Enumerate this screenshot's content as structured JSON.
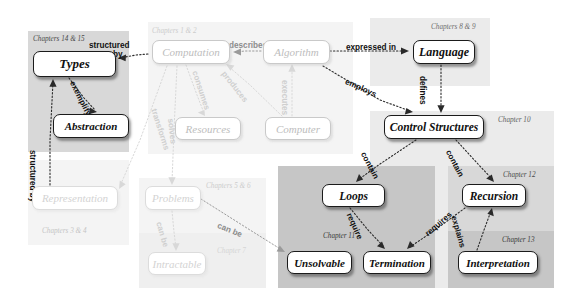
{
  "diagram": {
    "colors": {
      "region_dark": "#c6c6c6",
      "region_mid": "#d8d8d8",
      "region_light": "#ebebeb",
      "region_faint": "#f4f4f4",
      "node_strong_border": "#1b1b1b",
      "node_mid_border": "#7d7d7d",
      "node_faint_border": "#c9c9c9",
      "background": "#ffffff"
    },
    "regions": [
      {
        "name": "region-chapters-14-15",
        "label": "Chapters 14 & 15",
        "tone": "mid",
        "x": 28,
        "y": 31,
        "w": 101,
        "h": 121,
        "label_x": 33,
        "label_y": 35,
        "label_size": 7.2,
        "label_color": "#4a4a4a"
      },
      {
        "name": "region-chapters-3-4",
        "label": "Chapters 3 & 4",
        "tone": "faint",
        "x": 28,
        "y": 160,
        "w": 101,
        "h": 85,
        "label_x": 42,
        "label_y": 227,
        "label_size": 7.2,
        "label_color": "#c4c4c4"
      },
      {
        "name": "region-chapters-1-2",
        "label": "Chapters 1 & 2",
        "tone": "faint",
        "x": 148,
        "y": 22,
        "w": 205,
        "h": 132,
        "label_x": 152,
        "label_y": 27,
        "label_size": 7.2,
        "label_color": "#cccccc"
      },
      {
        "name": "region-chapters-5-6",
        "label": "Chapters 5 & 6",
        "tone": "faint",
        "x": 139,
        "y": 178,
        "w": 127,
        "h": 110,
        "label_x": 206,
        "label_y": 182,
        "label_size": 7.2,
        "label_color": "#cccccc"
      },
      {
        "name": "region-chapter-7",
        "label": "Chapter 7",
        "tone": "faint2",
        "x": 139,
        "y": 233,
        "w": 127,
        "h": 55,
        "label_x": 217,
        "label_y": 247,
        "label_size": 7.2,
        "label_color": "#d5d5d5"
      },
      {
        "name": "region-chapters-8-9",
        "label": "Chapters 8 & 9",
        "tone": "light",
        "x": 370,
        "y": 18,
        "w": 120,
        "h": 68,
        "label_x": 431,
        "label_y": 23,
        "label_size": 7.2,
        "label_color": "#6e6e6e"
      },
      {
        "name": "region-chapter-10",
        "label": "Chapter 10",
        "tone": "light",
        "x": 370,
        "y": 111,
        "w": 184,
        "h": 177,
        "label_x": 498,
        "label_y": 116,
        "label_size": 7.2,
        "label_color": "#5f5f5f"
      },
      {
        "name": "region-chapter-12",
        "label": "Chapter 12",
        "tone": "mid",
        "x": 448,
        "y": 166,
        "w": 106,
        "h": 122,
        "label_x": 503,
        "label_y": 171,
        "label_size": 7.2,
        "label_color": "#4a4a4a"
      },
      {
        "name": "region-chapter-11",
        "label": "Chapter 11",
        "tone": "dark",
        "x": 278,
        "y": 166,
        "w": 157,
        "h": 122,
        "label_x": 323,
        "label_y": 232,
        "label_size": 7.2,
        "label_color": "#3a3a3a"
      },
      {
        "name": "region-chapter-13",
        "label": "Chapter 13",
        "tone": "dark",
        "x": 448,
        "y": 231,
        "w": 106,
        "h": 57,
        "label_x": 502,
        "label_y": 236,
        "label_size": 7.2,
        "label_color": "#3a3a3a"
      }
    ],
    "nodes": [
      {
        "name": "node-types",
        "label": "Types",
        "style": "strong",
        "x": 33,
        "y": 51,
        "w": 83,
        "h": 26,
        "fs": 13
      },
      {
        "name": "node-abstraction",
        "label": "Abstraction",
        "style": "strong",
        "x": 53,
        "y": 114,
        "w": 76,
        "h": 24,
        "fs": 11
      },
      {
        "name": "node-representation",
        "label": "Representation",
        "style": "fainter",
        "x": 32,
        "y": 186,
        "w": 86,
        "h": 24,
        "fs": 11
      },
      {
        "name": "node-computation",
        "label": "Computation",
        "style": "faint",
        "x": 152,
        "y": 40,
        "w": 78,
        "h": 24,
        "fs": 11
      },
      {
        "name": "node-resources",
        "label": "Resources",
        "style": "faint",
        "x": 175,
        "y": 117,
        "w": 66,
        "h": 23,
        "fs": 11
      },
      {
        "name": "node-algorithm",
        "label": "Algorithm",
        "style": "faint",
        "x": 263,
        "y": 40,
        "w": 67,
        "h": 24,
        "fs": 11
      },
      {
        "name": "node-computer",
        "label": "Computer",
        "style": "faint",
        "x": 265,
        "y": 117,
        "w": 66,
        "h": 23,
        "fs": 11
      },
      {
        "name": "node-problems",
        "label": "Problems",
        "style": "fainter",
        "x": 145,
        "y": 186,
        "w": 56,
        "h": 24,
        "fs": 11
      },
      {
        "name": "node-intractable",
        "label": "Intractable",
        "style": "fainter",
        "x": 148,
        "y": 252,
        "w": 58,
        "h": 23,
        "fs": 11
      },
      {
        "name": "node-language",
        "label": "Language",
        "style": "strong",
        "x": 413,
        "y": 40,
        "w": 62,
        "h": 24,
        "fs": 12
      },
      {
        "name": "node-control-structures",
        "label": "Control Structures",
        "style": "strong",
        "x": 384,
        "y": 115,
        "w": 100,
        "h": 24,
        "fs": 11.5
      },
      {
        "name": "node-loops",
        "label": "Loops",
        "style": "strong",
        "x": 322,
        "y": 184,
        "w": 63,
        "h": 23,
        "fs": 11.5
      },
      {
        "name": "node-recursion",
        "label": "Recursion",
        "style": "strong",
        "x": 462,
        "y": 184,
        "w": 64,
        "h": 23,
        "fs": 11.5
      },
      {
        "name": "node-unsolvable",
        "label": "Unsolvable",
        "style": "strong",
        "x": 287,
        "y": 251,
        "w": 65,
        "h": 23,
        "fs": 11
      },
      {
        "name": "node-termination",
        "label": "Termination",
        "style": "strong",
        "x": 363,
        "y": 251,
        "w": 68,
        "h": 23,
        "fs": 11
      },
      {
        "name": "node-interpretation",
        "label": "Interpretation",
        "style": "strong",
        "x": 458,
        "y": 251,
        "w": 80,
        "h": 23,
        "fs": 11
      }
    ],
    "edges": [
      {
        "name": "edge-computation-structured-by-types",
        "label": "structured by",
        "tone": "dark",
        "from": "node-computation",
        "to": "node-types"
      },
      {
        "name": "edge-types-exemplify-abstraction",
        "label": "exemplify",
        "tone": "dark",
        "from": "node-types",
        "to": "node-abstraction"
      },
      {
        "name": "edge-representation-structured-by-types",
        "label": "structured by",
        "tone": "dark",
        "from": "node-representation",
        "to": "node-types"
      },
      {
        "name": "edge-algorithm-describes-computation",
        "label": "describes",
        "tone": "gray",
        "from": "node-algorithm",
        "to": "node-computation"
      },
      {
        "name": "edge-computation-consumes-resources",
        "label": "consumes",
        "tone": "pale",
        "from": "node-computation",
        "to": "node-resources"
      },
      {
        "name": "edge-computer-produces-computation",
        "label": "produces",
        "tone": "pale",
        "from": "node-computer",
        "to": "node-computation"
      },
      {
        "name": "edge-computer-executes-algorithm",
        "label": "executes",
        "tone": "pale",
        "from": "node-computer",
        "to": "node-algorithm"
      },
      {
        "name": "edge-computation-transforms-representation",
        "label": "transforms",
        "tone": "pale",
        "from": "node-computation",
        "to": "node-representation"
      },
      {
        "name": "edge-computation-solves-problems",
        "label": "solves",
        "tone": "pale",
        "from": "node-computation",
        "to": "node-problems"
      },
      {
        "name": "edge-algorithm-expressed-in-language",
        "label": "expressed in",
        "tone": "dark",
        "from": "node-algorithm",
        "to": "node-language"
      },
      {
        "name": "edge-algorithm-employs-control-structures",
        "label": "employs",
        "tone": "dark",
        "from": "node-algorithm",
        "to": "node-control-structures"
      },
      {
        "name": "edge-language-defines-control-structures",
        "label": "defines",
        "tone": "dark",
        "from": "node-language",
        "to": "node-control-structures"
      },
      {
        "name": "edge-control-structures-contain-loops",
        "label": "contain",
        "tone": "dark",
        "from": "node-control-structures",
        "to": "node-loops"
      },
      {
        "name": "edge-control-structures-contain-recursion",
        "label": "contain",
        "tone": "dark",
        "from": "node-control-structures",
        "to": "node-recursion"
      },
      {
        "name": "edge-loops-require-termination",
        "label": "require",
        "tone": "dark",
        "from": "node-loops",
        "to": "node-termination"
      },
      {
        "name": "edge-recursion-requires-termination",
        "label": "requires",
        "tone": "dark",
        "from": "node-recursion",
        "to": "node-termination"
      },
      {
        "name": "edge-interpretation-explains-recursion",
        "label": "explains",
        "tone": "dark",
        "from": "node-interpretation",
        "to": "node-recursion"
      },
      {
        "name": "edge-problems-can-be-intractable",
        "label": "can be",
        "tone": "pale",
        "from": "node-problems",
        "to": "node-intractable"
      },
      {
        "name": "edge-problems-can-be-unsolvable",
        "label": "can be",
        "tone": "gray",
        "from": "node-problems",
        "to": "node-unsolvable"
      }
    ],
    "edge_labels": [
      {
        "name": "edge-label-structured-by-top",
        "text": "structured",
        "tone": "dark",
        "x": 89,
        "y": 42,
        "fs": 8.2,
        "rot": 0,
        "align": "left"
      },
      {
        "name": "edge-label-structured-by-top2",
        "text": "by",
        "tone": "dark",
        "x": 113,
        "y": 51,
        "fs": 8.2,
        "rot": 0,
        "align": "left"
      },
      {
        "name": "edge-label-exemplify",
        "text": "exemplify",
        "tone": "dark",
        "x": 75,
        "y": 80,
        "fs": 8.2,
        "rot": 63,
        "align": "left"
      },
      {
        "name": "edge-label-structured-by-left",
        "text": "structured by",
        "tone": "dark",
        "x": 36,
        "y": 150,
        "fs": 8.2,
        "rot": 90,
        "align": "left"
      },
      {
        "name": "edge-label-describes",
        "text": "describes",
        "tone": "gray",
        "x": 229,
        "y": 42,
        "fs": 8.2,
        "rot": 0,
        "align": "left"
      },
      {
        "name": "edge-label-consumes",
        "text": "consumes",
        "tone": "pale",
        "x": 198,
        "y": 70,
        "fs": 8.2,
        "rot": 72,
        "align": "left"
      },
      {
        "name": "edge-label-produces",
        "text": "produces",
        "tone": "pale",
        "x": 226,
        "y": 70,
        "fs": 8.2,
        "rot": 52,
        "align": "left"
      },
      {
        "name": "edge-label-executes",
        "text": "executes",
        "tone": "pale",
        "x": 288,
        "y": 80,
        "fs": 8.2,
        "rot": 90,
        "align": "left"
      },
      {
        "name": "edge-label-transforms",
        "text": "transforms",
        "tone": "pale",
        "x": 157,
        "y": 108,
        "fs": 8.2,
        "rot": 72,
        "align": "left"
      },
      {
        "name": "edge-label-solves",
        "text": "solves",
        "tone": "pale",
        "x": 174,
        "y": 118,
        "fs": 8.2,
        "rot": 84,
        "align": "left"
      },
      {
        "name": "edge-label-expressed-in",
        "text": "expressed in",
        "tone": "dark",
        "x": 346,
        "y": 44,
        "fs": 8.2,
        "rot": 0,
        "align": "left"
      },
      {
        "name": "edge-label-employs",
        "text": "employs",
        "tone": "dark",
        "x": 347,
        "y": 78,
        "fs": 8.2,
        "rot": 24,
        "align": "left"
      },
      {
        "name": "edge-label-defines",
        "text": "defines",
        "tone": "dark",
        "x": 426,
        "y": 76,
        "fs": 8.2,
        "rot": 90,
        "align": "left"
      },
      {
        "name": "edge-label-contain-left",
        "text": "contain",
        "tone": "dark",
        "x": 366,
        "y": 151,
        "fs": 8.2,
        "rot": 62,
        "align": "left"
      },
      {
        "name": "edge-label-contain-right",
        "text": "contain",
        "tone": "dark",
        "x": 451,
        "y": 149,
        "fs": 8.2,
        "rot": 62,
        "align": "left"
      },
      {
        "name": "edge-label-require",
        "text": "require",
        "tone": "dark",
        "x": 352,
        "y": 212,
        "fs": 8.2,
        "rot": 66,
        "align": "left"
      },
      {
        "name": "edge-label-requires",
        "text": "requires",
        "tone": "dark",
        "x": 424,
        "y": 232,
        "fs": 8.2,
        "rot": -41,
        "align": "left"
      },
      {
        "name": "edge-label-explains",
        "text": "explains",
        "tone": "dark",
        "x": 457,
        "y": 215,
        "fs": 8.2,
        "rot": 74,
        "align": "left"
      },
      {
        "name": "edge-label-can-be-down",
        "text": "can be",
        "tone": "pale",
        "x": 162,
        "y": 221,
        "fs": 8.2,
        "rot": 74,
        "align": "left"
      },
      {
        "name": "edge-label-can-be-right",
        "text": "can be",
        "tone": "gray",
        "x": 219,
        "y": 222,
        "fs": 8.2,
        "rot": 22,
        "align": "left"
      }
    ],
    "arrows": [
      {
        "name": "arrow-computation-to-types",
        "tone": "dark",
        "d": "M 148 54 L 136 55 L 120 58",
        "head": "M 118 58 l 8 -3.4 l -0.4 6.6 z"
      },
      {
        "name": "arrow-types-to-abstraction",
        "tone": "dark",
        "d": "M 69 78 L 84 98 L 95 110",
        "head": "M 97 112 l -8.2 2.2 l 1.2 -6.6 z"
      },
      {
        "name": "arrow-representation-to-types",
        "tone": "dark",
        "d": "M 50 185 L 50 140 L 53 82",
        "head": "M 53 79 l 3.6 7.8 l -7.2 0 z"
      },
      {
        "name": "arrow-algorithm-to-computation",
        "tone": "gray",
        "d": "M 261 51 L 245 51 L 236 52",
        "head": "M 233 52 l 8 -3.4 l 0 6.8 z"
      },
      {
        "name": "arrow-computation-to-resources",
        "tone": "pale",
        "d": "M 186 65 L 197 95 L 204 113",
        "head": "M 205 116 l -7.2 -3.4 l 6.6 -2.6 z"
      },
      {
        "name": "arrow-computer-to-computation",
        "tone": "pale",
        "d": "M 282 116 L 250 85 L 228 66",
        "head": "M 226 64 l 8.4 1.6 l -4 5.2 z"
      },
      {
        "name": "arrow-computer-to-algorithm",
        "tone": "pale",
        "d": "M 292 116 L 292 90 L 292 67",
        "head": "M 292 64 l 3.6 7.8 l -7.2 0 z"
      },
      {
        "name": "arrow-computation-to-represent",
        "tone": "pale",
        "d": "M 167 66 L 140 140 L 120 186",
        "head": "M 119 189 l 0.8 -8.4 l 5.8 3.6 z"
      },
      {
        "name": "arrow-computation-to-problems",
        "tone": "pale",
        "d": "M 177 66 L 174 130 L 172 182",
        "head": "M 172 185 l -3.6 -7.8 l 7.2 0 z"
      },
      {
        "name": "arrow-algorithm-to-language",
        "tone": "dark",
        "d": "M 330 51 L 380 51 L 406 51",
        "head": "M 409 51 l -8 -3.4 l 0 6.8 z"
      },
      {
        "name": "arrow-algorithm-to-control",
        "tone": "dark",
        "d": "M 323 66 L 380 100 L 410 111",
        "head": "M 413 112 l -8.2 2.6 l 1.6 -6.6 z"
      },
      {
        "name": "arrow-language-to-control",
        "tone": "dark",
        "d": "M 441 65 L 441 90 L 441 110",
        "head": "M 441 113 l -3.6 -7.8 l 7.2 0 z"
      },
      {
        "name": "arrow-control-to-loops",
        "tone": "dark",
        "d": "M 416 140 L 380 164 L 358 180",
        "head": "M 356 182 l 3 -8 l 4.2 5.4 z"
      },
      {
        "name": "arrow-control-to-recursion",
        "tone": "dark",
        "d": "M 456 140 L 478 164 L 492 179",
        "head": "M 494 182 l -7.8 -3.4 l 5.6 -4.2 z"
      },
      {
        "name": "arrow-loops-to-termination",
        "tone": "dark",
        "d": "M 350 208 L 368 230 L 383 246",
        "head": "M 385 249 l -8 -2.8 l 5 -4.8 z"
      },
      {
        "name": "arrow-recursion-to-termination",
        "tone": "dark",
        "d": "M 465 208 L 435 230 L 410 247",
        "head": "M 407 249 l 3 -8 l 4.6 5.2 z"
      },
      {
        "name": "arrow-interpretation-to-recursion",
        "tone": "dark",
        "d": "M 477 250 L 484 230 L 491 211",
        "head": "M 492 208 l 1.8 8.2 l -6.4 -2.4 z"
      },
      {
        "name": "arrow-problems-to-intractable",
        "tone": "pale",
        "d": "M 172 211 L 174 232 L 176 248",
        "head": "M 176 251 l -3.6 -7.8 l 7.2 0 z"
      },
      {
        "name": "arrow-problems-to-unsolvable",
        "tone": "gray",
        "d": "M 201 199 L 250 230 L 282 250",
        "head": "M 285 252 l -8.4 -0.6 l 3.2 -5.8 z"
      }
    ]
  }
}
